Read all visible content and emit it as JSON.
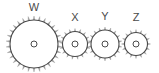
{
  "figure": {
    "background_color": "#ffffff",
    "stroke_color": "#4a4a4a",
    "tooth_fill_color": "#9a9a9a",
    "label_color": "#4a4a4a",
    "canvas": {
      "width": 159,
      "height": 73
    }
  },
  "gears": [
    {
      "id": "w",
      "label": "W",
      "center_x": 34,
      "center_y": 44,
      "body_radius": 24,
      "tooth_radius": 28,
      "teeth": 30,
      "hub_radius": 3,
      "label_x": 34,
      "label_y": 2
    },
    {
      "id": "x",
      "label": "X",
      "center_x": 75,
      "center_y": 44,
      "body_radius": 12.5,
      "tooth_radius": 15.5,
      "teeth": 17,
      "hub_radius": 3,
      "label_x": 75,
      "label_y": 12
    },
    {
      "id": "y",
      "label": "Y",
      "center_x": 105,
      "center_y": 44,
      "body_radius": 14,
      "tooth_radius": 17,
      "teeth": 18,
      "hub_radius": 3,
      "label_x": 105,
      "label_y": 11
    },
    {
      "id": "z",
      "label": "Z",
      "center_x": 136,
      "center_y": 44,
      "body_radius": 11.5,
      "tooth_radius": 14.5,
      "teeth": 16,
      "hub_radius": 3,
      "label_x": 136,
      "label_y": 12
    }
  ]
}
